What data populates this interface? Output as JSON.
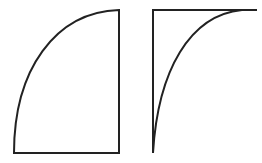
{
  "diagram": {
    "background": "#ffffff",
    "stroke_color": "#222222",
    "stroke_width": 2,
    "shapes": [
      {
        "id": "convex-quarter",
        "description": "Quarter-ellipse region bounded by straight right and bottom edges with a convex arc on the upper-left",
        "corner_top_right": [
          119,
          10
        ],
        "corner_bottom_right": [
          119,
          153
        ],
        "corner_bottom_left": [
          14,
          153
        ]
      },
      {
        "id": "concave-quarter",
        "description": "Region bounded by straight top and left edges with a concave arc from bottom-left to top-right",
        "corner_top_left": [
          153,
          10
        ],
        "top_edge_end": [
          257,
          10
        ],
        "curve_top_meet": [
          240,
          10
        ],
        "corner_bottom_left": [
          153,
          153
        ]
      }
    ]
  }
}
